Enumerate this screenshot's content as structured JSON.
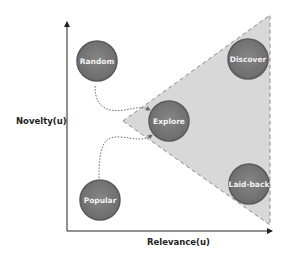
{
  "axes": {
    "x_label": "Relevance(u)",
    "y_label": "Novelty(u)"
  },
  "nodes": [
    {
      "id": "random",
      "label": "Random",
      "cx": 97,
      "cy": 61
    },
    {
      "id": "discover",
      "label": "Discover",
      "cx": 248,
      "cy": 59
    },
    {
      "id": "explore",
      "label": "Explore",
      "cx": 169,
      "cy": 121
    },
    {
      "id": "laid-back",
      "label": "Laid-back",
      "cx": 249,
      "cy": 184
    },
    {
      "id": "popular",
      "label": "Popular",
      "cx": 100,
      "cy": 200
    }
  ],
  "edges": [
    {
      "from": "Random",
      "to": "Explore",
      "style": "dotted-curve"
    },
    {
      "from": "Popular",
      "to": "Explore",
      "style": "dotted-curve"
    }
  ],
  "region": {
    "shape": "triangle",
    "fill": "#d4d4d4",
    "stroke": "#8a8a8a",
    "style": "dashed"
  },
  "colors": {
    "node_fill": "#7a7a7a",
    "node_stroke": "#5a5a5a",
    "node_text": "#f2f2f2",
    "axis": "#222222",
    "edge": "#6a6a6a"
  }
}
